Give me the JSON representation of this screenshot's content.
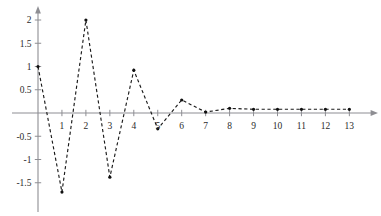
{
  "chart_data": {
    "type": "line",
    "title": "",
    "subtitle": "",
    "xlabel": "",
    "ylabel": "",
    "x": [
      0,
      1,
      2,
      3,
      4,
      5,
      6,
      7,
      8,
      9,
      10,
      11,
      12,
      13
    ],
    "values": [
      1.0,
      -1.7,
      2.0,
      -1.38,
      0.92,
      -0.34,
      0.28,
      0.02,
      0.1,
      0.08,
      0.08,
      0.08,
      0.08,
      0.08
    ],
    "series": [
      {
        "name": "damped oscillation",
        "values": [
          1.0,
          -1.7,
          2.0,
          -1.38,
          0.92,
          -0.34,
          0.28,
          0.02,
          0.1,
          0.08,
          0.08,
          0.08,
          0.08,
          0.08
        ]
      }
    ],
    "xlim": [
      -0.3,
      14.2
    ],
    "ylim": [
      -1.95,
      2.22
    ],
    "x_ticks": [
      1,
      2,
      3,
      4,
      5,
      6,
      7,
      8,
      9,
      10,
      11,
      12,
      13
    ],
    "x_tick_labels": [
      "1",
      "2",
      "3",
      "4",
      "5",
      "6",
      "7",
      "8",
      "9",
      "10",
      "11",
      "12",
      "13"
    ],
    "y_ticks": [
      -1.5,
      -1,
      -0.5,
      0.5,
      1,
      1.5,
      2
    ],
    "y_tick_labels": [
      "-1.5",
      "-1",
      "-0.5",
      "0.5",
      "1",
      "1.5",
      "2"
    ],
    "grid": false,
    "legend": null,
    "legend_position": "none",
    "line_style": "dashed",
    "marker": "dot",
    "annotations": [],
    "colors": {
      "line": "#1a1a1a",
      "marker": "#111111",
      "axis": "#8e8e93",
      "tick_text": "#2b2b2b",
      "background": "#ffffff"
    }
  }
}
